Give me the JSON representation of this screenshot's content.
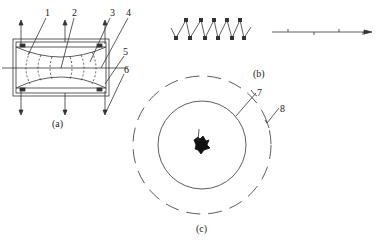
{
  "figure": {
    "panel_a": {
      "caption": "(a)",
      "labels": [
        "1",
        "2",
        "3",
        "4",
        "5",
        "6"
      ]
    },
    "panel_b": {
      "caption": "(b)"
    },
    "panel_c": {
      "caption": "(c)",
      "labels": [
        "7",
        "8"
      ]
    }
  },
  "colors": {
    "line": "#333333",
    "background": "#ffffff"
  }
}
